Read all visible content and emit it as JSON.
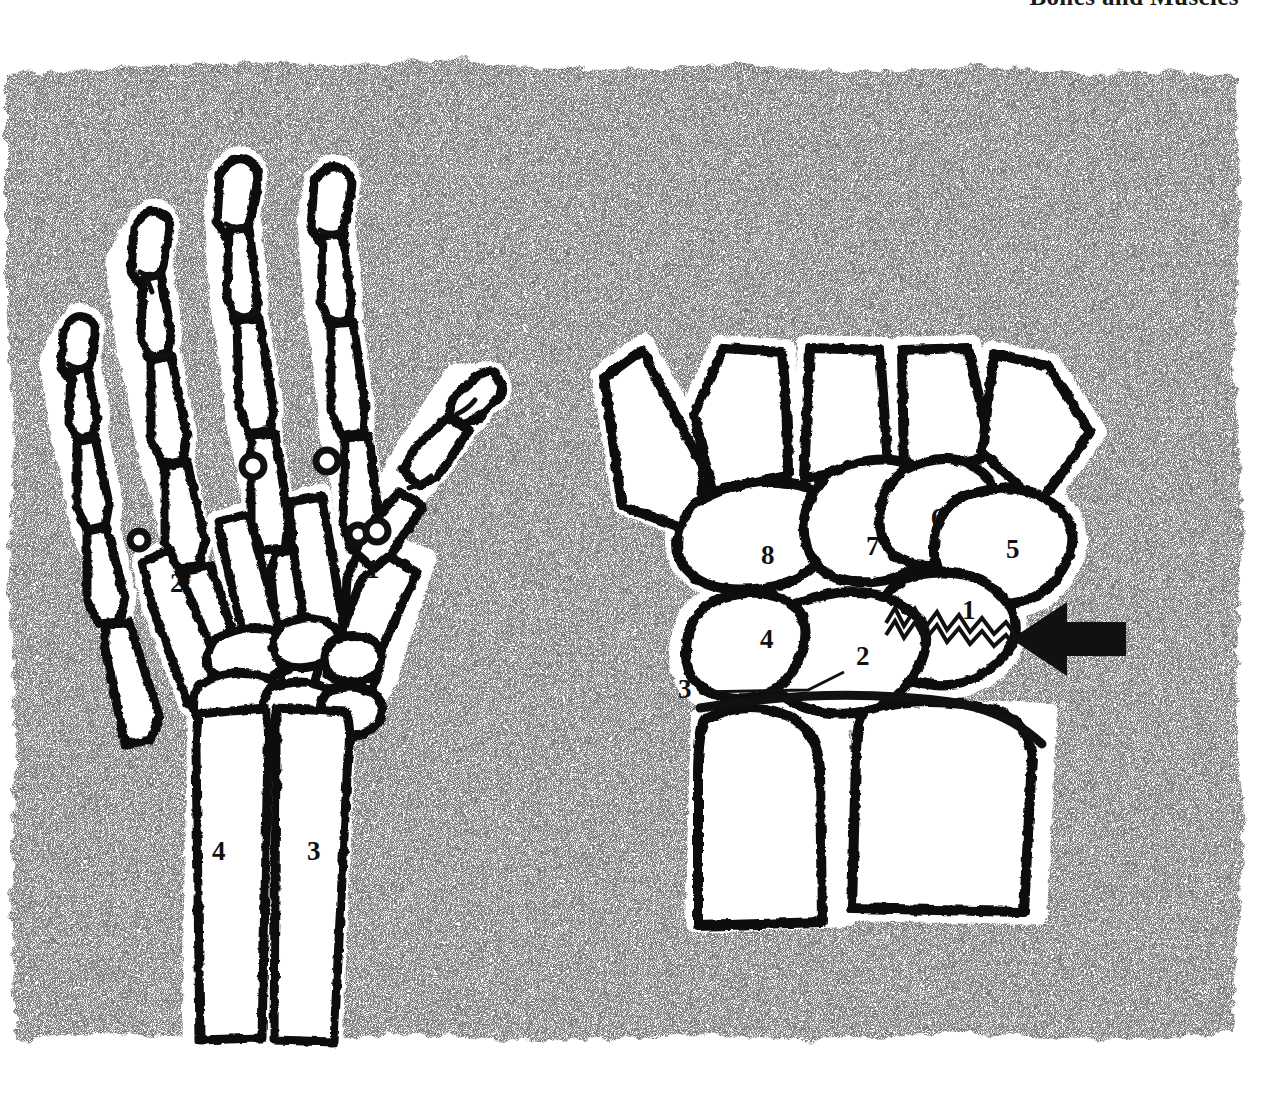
{
  "page": {
    "running_head": "Bones and Muscles",
    "background_color": "#ffffff",
    "plate_color": "#b4b4b4",
    "bone_fill": "#ffffff",
    "ink_color": "#111111",
    "halo_color": "#ffffff",
    "width": 1283,
    "height": 1095
  },
  "figures": [
    {
      "id": "left-hand-dorsal",
      "name": "Skeleton of the hand and distal forearm, dorsal view",
      "labels": [
        {
          "key": "1",
          "text": "1",
          "meaning": "first metacarpal (thumb)",
          "x": 366,
          "y": 556
        },
        {
          "key": "2",
          "text": "2",
          "meaning": "fifth metacarpal (little finger)",
          "x": 170,
          "y": 570
        },
        {
          "key": "3",
          "text": "3",
          "meaning": "radius",
          "x": 307,
          "y": 855
        },
        {
          "key": "4",
          "text": "4",
          "meaning": "ulna",
          "x": 212,
          "y": 842
        }
      ]
    },
    {
      "id": "right-wrist-carpus",
      "name": "Carpal bones with scaphoid fracture, enlarged view",
      "labels": [
        {
          "key": "1",
          "text": "1",
          "meaning": "scaphoid (fractured)",
          "x": 962,
          "y": 597
        },
        {
          "key": "2",
          "text": "2",
          "meaning": "lunate",
          "x": 856,
          "y": 643
        },
        {
          "key": "3",
          "text": "3",
          "meaning": "triquetrum / pisiform region",
          "x": 682,
          "y": 679
        },
        {
          "key": "4",
          "text": "4",
          "meaning": "hamate",
          "x": 762,
          "y": 629
        },
        {
          "key": "5",
          "text": "5",
          "meaning": "trapezium",
          "x": 1008,
          "y": 540
        },
        {
          "key": "6",
          "text": "6",
          "meaning": "trapezoid",
          "x": 933,
          "y": 510
        },
        {
          "key": "7",
          "text": "7",
          "meaning": "capitate",
          "x": 868,
          "y": 539
        },
        {
          "key": "8",
          "text": "8",
          "meaning": "hamate body",
          "x": 763,
          "y": 548
        }
      ],
      "annotations": [
        {
          "key": "fracture-arrow",
          "type": "arrow",
          "meaning": "arrow indicating fracture of the scaphoid",
          "direction": "left"
        },
        {
          "key": "fracture-line",
          "type": "jagged-line",
          "meaning": "jagged fracture line across the scaphoid"
        },
        {
          "key": "leader-3",
          "type": "leader-line",
          "meaning": "leader line from label 3 to the wrist joint"
        }
      ]
    }
  ]
}
